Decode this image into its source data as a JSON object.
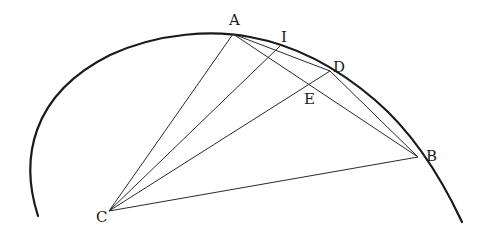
{
  "diagram": {
    "type": "geometric-construction",
    "colors": {
      "stroke": "#1a1a1a",
      "background": "#ffffff"
    },
    "points": {
      "A": {
        "label": "A",
        "x": 233,
        "y": 34,
        "lx": 229,
        "ly": 25
      },
      "I": {
        "label": "I",
        "x": 280,
        "y": 46,
        "lx": 281,
        "ly": 42
      },
      "D": {
        "label": "D",
        "x": 330,
        "y": 71,
        "lx": 333,
        "ly": 72
      },
      "E": {
        "label": "E",
        "x": 309,
        "y": 85,
        "lx": 304,
        "ly": 104
      },
      "B": {
        "label": "B",
        "x": 418,
        "y": 157,
        "lx": 426,
        "ly": 161
      },
      "C": {
        "label": "C",
        "x": 109,
        "y": 211,
        "lx": 96,
        "ly": 222
      }
    },
    "segments": [
      [
        "C",
        "A"
      ],
      [
        "C",
        "I"
      ],
      [
        "C",
        "D"
      ],
      [
        "C",
        "B"
      ],
      [
        "A",
        "D"
      ],
      [
        "A",
        "B"
      ],
      [
        "D",
        "B"
      ]
    ],
    "arc": "circular arc from lower-left through A, I, D, B to lower-right"
  }
}
